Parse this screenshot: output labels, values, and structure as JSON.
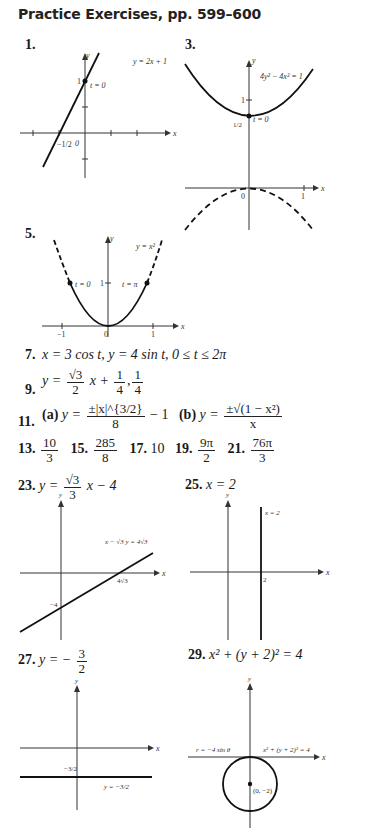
{
  "header": {
    "title": "Practice Exercises, pp. 599–600"
  },
  "exercises": {
    "e1": {
      "num": "1.",
      "curve_label": "y = 2x + 1",
      "point_label": "t = 0",
      "y_tick": "1",
      "x_tick": "−1/2",
      "origin": "0",
      "x_axis": "x",
      "y_axis": "y"
    },
    "e3": {
      "num": "3.",
      "curve_label": "4y² − 4x² = 1",
      "point_label": "t = 0",
      "y_tick_1": "1",
      "y_tick_half": "1/2",
      "x_tick": "1",
      "origin": "0",
      "x_axis": "x",
      "y_axis": "y"
    },
    "e5": {
      "num": "5.",
      "curve_label": "y = x²",
      "point_left": "t = 0",
      "point_right": "t = π",
      "y_tick": "1",
      "x_tick_neg": "−1",
      "x_tick_pos": "1",
      "origin": "0",
      "x_axis": "x",
      "y_axis": "y"
    },
    "e7": {
      "num": "7.",
      "text": "x = 3 cos t,   y = 4 sin t,   0 ≤ t ≤ 2π"
    },
    "e9": {
      "num": "9.",
      "pre": "y =",
      "frac1_n": "√3",
      "frac1_d": "2",
      "mid": "x +",
      "frac2_n": "1",
      "frac2_d": "4",
      "sep": ",",
      "frac3_n": "1",
      "frac3_d": "4"
    },
    "e11": {
      "num": "11.",
      "a_label": "(a)",
      "a_pre": "y =",
      "a_n": "±|x|^{3/2}",
      "a_d": "8",
      "a_post": "− 1",
      "b_label": "(b)",
      "b_pre": "y =",
      "b_n": "±√(1 − x²)",
      "b_d": "x"
    },
    "e13": {
      "num": "13.",
      "n": "10",
      "d": "3"
    },
    "e15": {
      "num": "15.",
      "n": "285",
      "d": "8"
    },
    "e17": {
      "num": "17.",
      "value": "10"
    },
    "e19": {
      "num": "19.",
      "n": "9π",
      "d": "2"
    },
    "e21": {
      "num": "21.",
      "n": "76π",
      "d": "3"
    },
    "e23": {
      "num": "23.",
      "pre": "y =",
      "n": "√3",
      "d": "3",
      "post": "x − 4",
      "curve_label": "x − √3 y = 4√3",
      "x_int": "4√3",
      "y_int": "−4",
      "x_axis": "x",
      "y_axis": "y"
    },
    "e25": {
      "num": "25.",
      "text": "x = 2",
      "curve_label": "x = 2",
      "x_tick": "2",
      "x_axis": "x",
      "y_axis": "y"
    },
    "e27": {
      "num": "27.",
      "pre": "y = −",
      "n": "3",
      "d": "2",
      "curve_label": "y = −3/2",
      "y_tick": "−3/2",
      "x_axis": "x",
      "y_axis": "y"
    },
    "e29": {
      "num": "29.",
      "text": "x² + (y + 2)² = 4",
      "polar_label": "r = −4 sin θ",
      "curve_label": "x² + (y + 2)² = 4",
      "center_label": "(0, −2)",
      "x_axis": "x",
      "y_axis": "y"
    }
  }
}
